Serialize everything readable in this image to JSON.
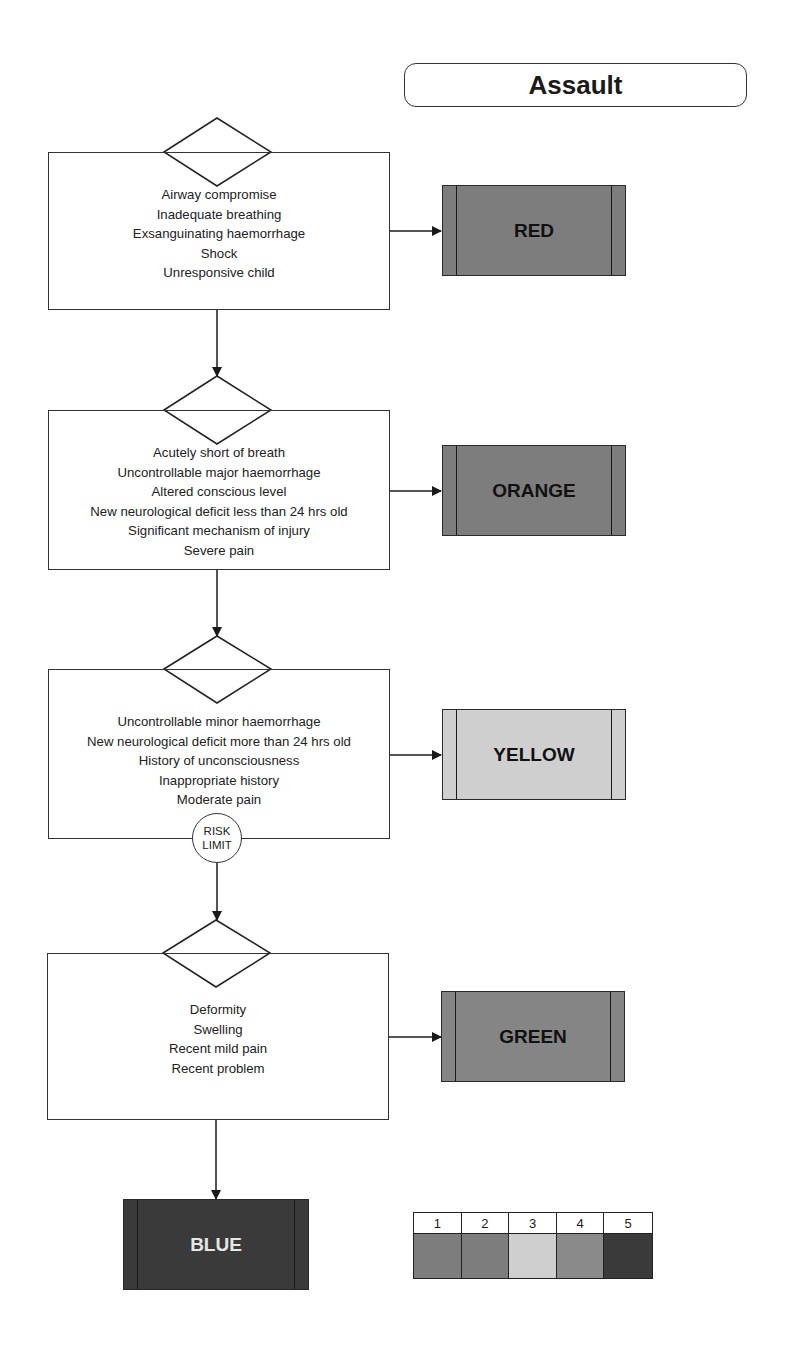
{
  "title": "Assault",
  "levels": [
    {
      "criteria": [
        "Airway compromise",
        "Inadequate breathing",
        "Exsanguinating haemorrhage",
        "Shock",
        "Unresponsive child"
      ],
      "category": "RED",
      "priority": 1
    },
    {
      "criteria": [
        "Acutely short of breath",
        "Uncontrollable major haemorrhage",
        "Altered conscious level",
        "New neurological deficit less than 24 hrs old",
        "Significant mechanism of injury",
        "Severe pain"
      ],
      "category": "ORANGE",
      "priority": 2
    },
    {
      "criteria": [
        "Uncontrollable minor haemorrhage",
        "New neurological deficit more than 24 hrs old",
        "History of unconsciousness",
        "Inappropriate history",
        "Moderate pain"
      ],
      "category": "YELLOW",
      "priority": 3
    },
    {
      "criteria": [
        "Deformity",
        "Swelling",
        "Recent mild pain",
        "Recent problem"
      ],
      "category": "GREEN",
      "priority": 4
    }
  ],
  "default_category": "BLUE",
  "risk_limit": {
    "line1": "RISK",
    "line2": "LIMIT"
  },
  "legend": {
    "numbers": [
      "1",
      "2",
      "3",
      "4",
      "5"
    ],
    "colors": [
      "#7d7d7d",
      "#7d7d7d",
      "#cfcfcf",
      "#8a8a8a",
      "#3a3a3a"
    ]
  },
  "colors": {
    "red": "#7d7d7d",
    "orange": "#7d7d7d",
    "yellow": "#cfcfcf",
    "green": "#858585",
    "blue": "#3a3a3a",
    "blue_text": "#e6e6e6",
    "line": "#1a1a1a"
  }
}
